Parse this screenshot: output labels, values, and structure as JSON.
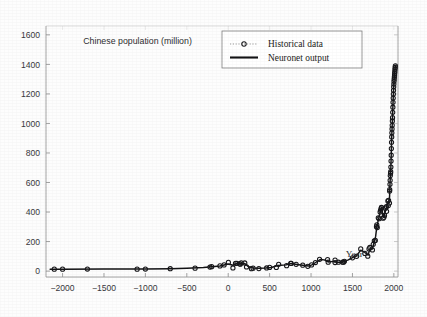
{
  "chart_data": {
    "type": "line",
    "title": "Chinese population (million)",
    "xlabel": "Year",
    "ylabel": "",
    "xlim": [
      -2200,
      2050
    ],
    "ylim": [
      -40,
      1660
    ],
    "xticks": [
      -2000,
      -1500,
      -1000,
      -500,
      0,
      500,
      1000,
      1500,
      2000
    ],
    "xticklabels": [
      "−2000",
      "−1500",
      "−1000",
      "−500",
      "0",
      "500",
      "1000",
      "1500",
      "2000"
    ],
    "yticks": [
      0,
      200,
      400,
      600,
      800,
      1000,
      1200,
      1400,
      1600
    ],
    "yticklabels": [
      "0",
      "200",
      "400",
      "600",
      "800",
      "1000",
      "1200",
      "1400",
      "1600"
    ],
    "grid": false,
    "legend_position": "top-center",
    "annotations": [
      {
        "text": "Chinese population (million)",
        "x": -1750,
        "y": 1540
      },
      {
        "text": "Year",
        "x": 1420,
        "y": 95
      }
    ],
    "series": [
      {
        "name": "Historical data",
        "style": "markers",
        "marker": "circle",
        "points": [
          [
            -2100,
            13
          ],
          [
            -2000,
            13
          ],
          [
            -1700,
            14
          ],
          [
            -1100,
            13
          ],
          [
            -1000,
            14
          ],
          [
            -700,
            16
          ],
          [
            -400,
            20
          ],
          [
            -220,
            27
          ],
          [
            -200,
            30
          ],
          [
            -100,
            35
          ],
          [
            -50,
            42
          ],
          [
            2,
            59
          ],
          [
            57,
            21
          ],
          [
            88,
            53
          ],
          [
            105,
            53
          ],
          [
            140,
            49
          ],
          [
            146,
            47
          ],
          [
            157,
            56
          ],
          [
            200,
            55
          ],
          [
            221,
            28
          ],
          [
            280,
            16
          ],
          [
            300,
            20
          ],
          [
            370,
            17
          ],
          [
            464,
            21
          ],
          [
            500,
            25
          ],
          [
            581,
            25
          ],
          [
            609,
            46
          ],
          [
            705,
            37
          ],
          [
            755,
            53
          ],
          [
            760,
            52
          ],
          [
            820,
            46
          ],
          [
            900,
            40
          ],
          [
            961,
            32
          ],
          [
            1006,
            42
          ],
          [
            1053,
            58
          ],
          [
            1103,
            80
          ],
          [
            1200,
            78
          ],
          [
            1207,
            60
          ],
          [
            1290,
            75
          ],
          [
            1290,
            58
          ],
          [
            1330,
            60
          ],
          [
            1381,
            60
          ],
          [
            1393,
            60
          ],
          [
            1403,
            66
          ],
          [
            1500,
            90
          ],
          [
            1550,
            100
          ],
          [
            1600,
            150
          ],
          [
            1650,
            120
          ],
          [
            1685,
            101
          ],
          [
            1700,
            150
          ],
          [
            1710,
            160
          ],
          [
            1741,
            143
          ],
          [
            1751,
            181
          ],
          [
            1764,
            205
          ],
          [
            1776,
            208
          ],
          [
            1790,
            301
          ],
          [
            1794,
            313
          ],
          [
            1800,
            295
          ],
          [
            1812,
            361
          ],
          [
            1821,
            355
          ],
          [
            1834,
            401
          ],
          [
            1840,
            412
          ],
          [
            1845,
            421
          ],
          [
            1850,
            430
          ],
          [
            1851,
            432
          ],
          [
            1870,
            358
          ],
          [
            1880,
            364
          ],
          [
            1887,
            377
          ],
          [
            1901,
            426
          ],
          [
            1910,
            436
          ],
          [
            1912,
            405
          ],
          [
            1928,
            475
          ],
          [
            1933,
            444
          ],
          [
            1936,
            479
          ],
          [
            1947,
            461
          ],
          [
            1949,
            542
          ],
          [
            1950,
            552
          ],
          [
            1953,
            588
          ],
          [
            1955,
            615
          ],
          [
            1957,
            647
          ],
          [
            1960,
            662
          ],
          [
            1962,
            673
          ],
          [
            1964,
            705
          ],
          [
            1966,
            745
          ],
          [
            1968,
            785
          ],
          [
            1970,
            830
          ],
          [
            1972,
            872
          ],
          [
            1974,
            909
          ],
          [
            1976,
            937
          ],
          [
            1978,
            963
          ],
          [
            1980,
            987
          ],
          [
            1982,
            1017
          ],
          [
            1984,
            1039
          ],
          [
            1986,
            1075
          ],
          [
            1988,
            1110
          ],
          [
            1990,
            1143
          ],
          [
            1992,
            1172
          ],
          [
            1994,
            1199
          ],
          [
            1996,
            1224
          ],
          [
            1998,
            1248
          ],
          [
            2000,
            1267
          ],
          [
            2002,
            1285
          ],
          [
            2004,
            1300
          ],
          [
            2006,
            1314
          ],
          [
            2008,
            1328
          ],
          [
            2010,
            1341
          ],
          [
            2012,
            1354
          ],
          [
            2014,
            1368
          ],
          [
            2016,
            1379
          ],
          [
            2018,
            1390
          ]
        ]
      },
      {
        "name": "Neuronet output",
        "style": "line",
        "points": [
          [
            -2150,
            12
          ],
          [
            -2000,
            13
          ],
          [
            -1500,
            14
          ],
          [
            -1000,
            14
          ],
          [
            -700,
            16
          ],
          [
            -500,
            19
          ],
          [
            -300,
            24
          ],
          [
            -200,
            29
          ],
          [
            -100,
            34
          ],
          [
            0,
            48
          ],
          [
            60,
            40
          ],
          [
            100,
            52
          ],
          [
            150,
            50
          ],
          [
            200,
            52
          ],
          [
            240,
            32
          ],
          [
            300,
            20
          ],
          [
            370,
            19
          ],
          [
            450,
            21
          ],
          [
            520,
            24
          ],
          [
            600,
            38
          ],
          [
            700,
            42
          ],
          [
            760,
            52
          ],
          [
            830,
            45
          ],
          [
            900,
            40
          ],
          [
            970,
            34
          ],
          [
            1010,
            42
          ],
          [
            1060,
            60
          ],
          [
            1110,
            78
          ],
          [
            1160,
            76
          ],
          [
            1210,
            62
          ],
          [
            1270,
            66
          ],
          [
            1320,
            60
          ],
          [
            1380,
            60
          ],
          [
            1405,
            66
          ],
          [
            1450,
            76
          ],
          [
            1500,
            92
          ],
          [
            1550,
            104
          ],
          [
            1600,
            142
          ],
          [
            1650,
            126
          ],
          [
            1690,
            108
          ],
          [
            1710,
            152
          ],
          [
            1740,
            150
          ],
          [
            1760,
            190
          ],
          [
            1780,
            235
          ],
          [
            1795,
            305
          ],
          [
            1810,
            340
          ],
          [
            1825,
            375
          ],
          [
            1840,
            410
          ],
          [
            1852,
            430
          ],
          [
            1865,
            390
          ],
          [
            1880,
            368
          ],
          [
            1895,
            400
          ],
          [
            1910,
            432
          ],
          [
            1925,
            460
          ],
          [
            1940,
            478
          ],
          [
            1948,
            500
          ],
          [
            1953,
            585
          ],
          [
            1958,
            650
          ],
          [
            1963,
            690
          ],
          [
            1968,
            780
          ],
          [
            1972,
            870
          ],
          [
            1976,
            935
          ],
          [
            1980,
            985
          ],
          [
            1984,
            1040
          ],
          [
            1988,
            1110
          ],
          [
            1992,
            1170
          ],
          [
            1996,
            1222
          ],
          [
            2000,
            1266
          ],
          [
            2004,
            1300
          ],
          [
            2008,
            1328
          ],
          [
            2012,
            1354
          ],
          [
            2016,
            1378
          ],
          [
            2018,
            1392
          ]
        ]
      }
    ],
    "legend": [
      {
        "label": "Historical data",
        "style": "marker-dotted"
      },
      {
        "label": "Neuronet output",
        "style": "solid-line"
      }
    ]
  },
  "colors": {
    "axis": "#8d8d8d",
    "data": "#131315",
    "text": "#2d2d31",
    "background": "#fdfdfd"
  }
}
